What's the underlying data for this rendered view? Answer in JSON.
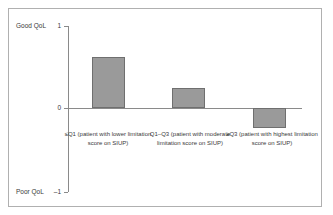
{
  "chart_data": {
    "type": "bar",
    "title": "",
    "xlabel": "",
    "ylabel": "",
    "ylim": [
      -1,
      1
    ],
    "grid": false,
    "legend": null,
    "categories": [
      "≤Q1 (patient with lower limitation score on SIUP)",
      "Q1–Q3 (patient with moderate limitation score on SIUP)",
      "≥Q3 (patient with highest limitation score on SIUP)"
    ],
    "values": [
      0.62,
      0.25,
      -0.24
    ],
    "yticks": [
      1,
      0,
      -1
    ],
    "ytick_labels": [
      "1",
      "0",
      "–1"
    ],
    "axis_annotations": {
      "top": "Good QoL",
      "bottom": "Poor QoL"
    },
    "bar_color": "#9a9a9a",
    "bar_edge_color": "#6f6f6f"
  },
  "axis": {
    "good_qol": "Good QoL",
    "poor_qol": "Poor QoL",
    "tick_top": "1",
    "tick_zero": "0",
    "tick_bottom": "–1"
  },
  "categories": [
    {
      "label": "≤Q1 (patient with lower limitation score on SIUP)"
    },
    {
      "label": "Q1–Q3 (patient with moderate limitation score on SIUP)"
    },
    {
      "label": "≥Q3 (patient with highest limitation score on SIUP)"
    }
  ]
}
